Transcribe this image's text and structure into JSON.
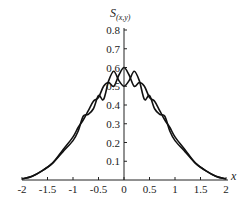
{
  "chart_data": {
    "type": "line",
    "title": "",
    "xlabel": "x",
    "ylabel": "S(x,y)",
    "xlim": [
      -2,
      2
    ],
    "ylim": [
      0,
      0.8
    ],
    "xticks": [
      "-2",
      "-1.5",
      "-1",
      "-0.5",
      "0",
      "0.5",
      "1",
      "1.5",
      "2"
    ],
    "xtick_values": [
      -2,
      -1.5,
      -1,
      -0.5,
      0,
      0.5,
      1,
      1.5,
      2
    ],
    "yticks": [
      "0.1",
      "0.2",
      "0.3",
      "0.4",
      "0.5",
      "0.6",
      "0.7",
      "0.8"
    ],
    "ytick_values": [
      0.1,
      0.2,
      0.3,
      0.4,
      0.5,
      0.6,
      0.7,
      0.8
    ],
    "grid": false,
    "legend": "none",
    "series": [
      {
        "name": "curve-1",
        "x": [
          -2,
          -1.8,
          -1.6,
          -1.4,
          -1.2,
          -1.0,
          -0.9,
          -0.8,
          -0.7,
          -0.6,
          -0.5,
          -0.4,
          -0.3,
          -0.2,
          -0.1,
          0,
          0.1,
          0.2,
          0.3,
          0.4,
          0.5,
          0.6,
          0.7,
          0.8,
          0.9,
          1.0,
          1.2,
          1.4,
          1.6,
          1.8,
          2
        ],
        "values": [
          0.005,
          0.02,
          0.05,
          0.09,
          0.16,
          0.23,
          0.28,
          0.32,
          0.37,
          0.42,
          0.44,
          0.5,
          0.52,
          0.5,
          0.56,
          0.6,
          0.56,
          0.5,
          0.52,
          0.5,
          0.44,
          0.42,
          0.37,
          0.32,
          0.28,
          0.23,
          0.16,
          0.09,
          0.05,
          0.02,
          0.005
        ]
      },
      {
        "name": "curve-2",
        "x": [
          -2,
          -1.8,
          -1.6,
          -1.4,
          -1.2,
          -1.0,
          -0.9,
          -0.8,
          -0.7,
          -0.6,
          -0.5,
          -0.4,
          -0.3,
          -0.2,
          -0.1,
          0,
          0.1,
          0.2,
          0.3,
          0.4,
          0.5,
          0.6,
          0.7,
          0.8,
          0.9,
          1.0,
          1.2,
          1.4,
          1.6,
          1.8,
          2
        ],
        "values": [
          0.005,
          0.02,
          0.05,
          0.09,
          0.15,
          0.21,
          0.26,
          0.34,
          0.35,
          0.38,
          0.45,
          0.43,
          0.53,
          0.58,
          0.53,
          0.5,
          0.53,
          0.58,
          0.53,
          0.43,
          0.45,
          0.38,
          0.35,
          0.34,
          0.26,
          0.21,
          0.15,
          0.09,
          0.05,
          0.02,
          0.005
        ]
      }
    ]
  }
}
